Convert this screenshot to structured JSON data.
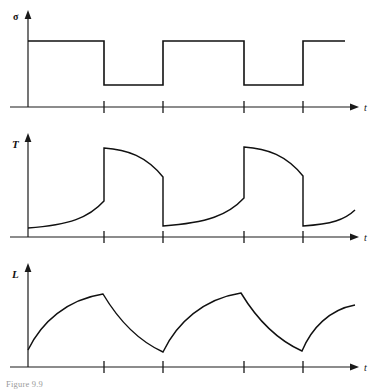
{
  "figure": {
    "caption": "Figure 9.9",
    "background_color": "#ffffff",
    "line_color": "#111111",
    "panel_count": 3
  },
  "panels": [
    {
      "id": "sigma-panel",
      "y_axis_label": "σ",
      "x_axis_label": "t",
      "waveform": "square",
      "description": "Periodic square stress wave alternating between high and low levels"
    },
    {
      "id": "temperature-panel",
      "y_axis_label": "T",
      "x_axis_label": "t",
      "waveform": "sawtooth-exponential",
      "description": "Temperature rising exponentially, jumping up at stress drop, decaying, then dropping"
    },
    {
      "id": "length-panel",
      "y_axis_label": "L",
      "x_axis_label": "t",
      "waveform": "triangular-curved",
      "description": "Length rising concavely to a peak then falling convexly to a minimum"
    }
  ],
  "chart_data": [
    {
      "type": "line",
      "id": "sigma-panel",
      "title": "",
      "xlabel": "t",
      "ylabel": "σ",
      "grid": false,
      "legend": "none",
      "axis_origin": [
        28,
        107
      ],
      "x_axis_end": 358,
      "xlim": [
        28,
        358
      ],
      "ylim": [
        107,
        12
      ],
      "tick_positions_x": [
        104,
        163,
        244,
        303
      ],
      "high_level": 41,
      "low_level": 85,
      "points": [
        [
          28,
          41
        ],
        [
          104,
          41
        ],
        [
          104,
          85
        ],
        [
          163,
          85
        ],
        [
          163,
          41
        ],
        [
          244,
          41
        ],
        [
          244,
          85
        ],
        [
          303,
          85
        ],
        [
          303,
          41
        ],
        [
          345,
          41
        ]
      ]
    },
    {
      "type": "line",
      "id": "temperature-panel",
      "title": "",
      "xlabel": "t",
      "ylabel": "T",
      "grid": false,
      "legend": "none",
      "axis_origin": [
        28,
        237
      ],
      "x_axis_end": 358,
      "xlim": [
        28,
        358
      ],
      "ylim": [
        237,
        130
      ],
      "tick_positions_x": [
        104,
        163,
        244,
        303
      ],
      "segments": [
        {
          "kind": "rise",
          "x0": 28,
          "y0": 228,
          "x1": 104,
          "y1": 201
        },
        {
          "kind": "jump-up",
          "x": 104,
          "y_from": 201,
          "y_to": 148
        },
        {
          "kind": "decay",
          "x0": 104,
          "y0": 148,
          "x1": 163,
          "y1": 177
        },
        {
          "kind": "jump-down",
          "x": 163,
          "y_from": 177,
          "y_to": 226
        },
        {
          "kind": "rise",
          "x0": 163,
          "y0": 226,
          "x1": 244,
          "y1": 198
        },
        {
          "kind": "jump-up",
          "x": 244,
          "y_from": 198,
          "y_to": 147
        },
        {
          "kind": "decay",
          "x0": 244,
          "y0": 147,
          "x1": 303,
          "y1": 176
        },
        {
          "kind": "jump-down",
          "x": 303,
          "y_from": 176,
          "y_to": 226
        },
        {
          "kind": "rise",
          "x0": 303,
          "y0": 226,
          "x1": 355,
          "y1": 210
        }
      ]
    },
    {
      "type": "line",
      "id": "length-panel",
      "title": "",
      "xlabel": "t",
      "ylabel": "L",
      "grid": false,
      "legend": "none",
      "axis_origin": [
        28,
        367
      ],
      "x_axis_end": 358,
      "xlim": [
        28,
        358
      ],
      "ylim": [
        367,
        258
      ],
      "tick_positions_x": [
        104,
        163,
        244,
        303
      ],
      "key_points": [
        {
          "label": "start",
          "x": 28,
          "y": 350
        },
        {
          "label": "peak-1",
          "x": 103,
          "y": 294
        },
        {
          "label": "min-1",
          "x": 163,
          "y": 352
        },
        {
          "label": "peak-2",
          "x": 241,
          "y": 293
        },
        {
          "label": "min-2",
          "x": 302,
          "y": 351
        },
        {
          "label": "end",
          "x": 355,
          "y": 305
        }
      ]
    }
  ]
}
